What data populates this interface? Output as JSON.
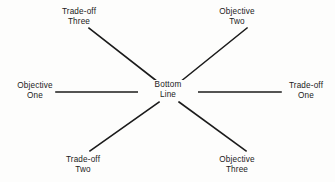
{
  "diagram": {
    "type": "radial-spoke-diagram",
    "background_color": "#fdfdfc",
    "line_color": "#1b1b1b",
    "text_color": "#1b1b1b",
    "center": {
      "name": "bottom-line",
      "line_1": "Bottom",
      "line_2": "Line"
    },
    "nodes": [
      {
        "name": "trade-off-three",
        "position": "top-left",
        "line_1": "Trade-off",
        "line_2": "Three"
      },
      {
        "name": "objective-two",
        "position": "top-right",
        "line_1": "Objective",
        "line_2": "Two"
      },
      {
        "name": "objective-one",
        "position": "middle-left",
        "line_1": "Objective",
        "line_2": "One"
      },
      {
        "name": "trade-off-one",
        "position": "middle-right",
        "line_1": "Trade-off",
        "line_2": "One"
      },
      {
        "name": "trade-off-two",
        "position": "bottom-left",
        "line_1": "Trade-off",
        "line_2": "Two"
      },
      {
        "name": "objective-three",
        "position": "bottom-right",
        "line_1": "Objective",
        "line_2": "Three"
      }
    ],
    "spokes": [
      {
        "name": "spoke-to-trade-off-three",
        "x1": 158,
        "y1": 82,
        "x2": 89,
        "y2": 28
      },
      {
        "name": "spoke-to-objective-two",
        "x1": 180,
        "y1": 82,
        "x2": 247,
        "y2": 28
      },
      {
        "name": "spoke-to-objective-one",
        "x1": 150,
        "y1": 92,
        "x2": 56,
        "y2": 92
      },
      {
        "name": "spoke-to-trade-off-one",
        "x1": 188,
        "y1": 92,
        "x2": 281,
        "y2": 92
      },
      {
        "name": "spoke-to-trade-off-two",
        "x1": 159,
        "y1": 102,
        "x2": 90,
        "y2": 151
      },
      {
        "name": "spoke-to-objective-three",
        "x1": 179,
        "y1": 102,
        "x2": 246,
        "y2": 151
      }
    ]
  }
}
